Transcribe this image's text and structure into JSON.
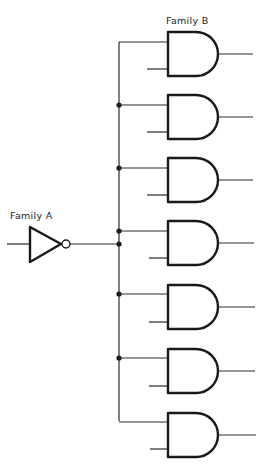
{
  "labels": {
    "family_a": "Family A",
    "family_b": "Family B"
  },
  "colors": {
    "ink": "#1a1a1a",
    "background": "#ffffff"
  },
  "inverter": {
    "type": "NOT",
    "family": "A",
    "count": 1
  },
  "and_gates": {
    "type": "AND",
    "family": "B",
    "count": 7,
    "inputs_per_gate": 2
  }
}
